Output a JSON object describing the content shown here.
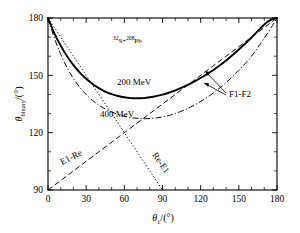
{
  "figure": {
    "system_label": "S+",
    "system_sup1": "32",
    "system_sup2": "208",
    "system_tail": "Pb"
  },
  "axes": {
    "x": {
      "label_main": "θ",
      "label_sub": "1",
      "label_unit": "/(°)",
      "ticks": [
        "0",
        "30",
        "60",
        "90",
        "120",
        "150",
        "180"
      ],
      "tick_values": [
        0,
        30,
        60,
        90,
        120,
        150,
        180
      ],
      "minor_step": 10,
      "min": 0,
      "max": 180
    },
    "y": {
      "label_main": "θ",
      "label_sub": "binary",
      "label_unit": "/(°)",
      "ticks": [
        "90",
        "120",
        "150",
        "180"
      ],
      "tick_values": [
        90,
        120,
        150,
        180
      ],
      "minor_step": 10,
      "min": 90,
      "max": 180
    }
  },
  "annotations": [
    {
      "name": "label-200mev",
      "text": "200 MeV"
    },
    {
      "name": "label-400mev",
      "text": "400 MeV"
    },
    {
      "name": "label-f1f2",
      "text": "F1-F2"
    },
    {
      "name": "label-e1re",
      "text": "E1-Re"
    },
    {
      "name": "label-ree1",
      "text": "Re-E1"
    }
  ],
  "chart_data": {
    "type": "line",
    "title": "32S+208Pb",
    "xlabel": "theta_1/(deg)",
    "ylabel": "theta_binary/(deg)",
    "xlim": [
      0,
      180
    ],
    "ylim": [
      90,
      180
    ],
    "grid": false,
    "legend": "inline-annotations",
    "series": [
      {
        "name": "200 MeV",
        "style": "solid",
        "annotation": "200 MeV",
        "x": [
          0,
          5,
          10,
          15,
          20,
          25,
          30,
          35,
          40,
          45,
          50,
          55,
          60,
          65,
          70,
          75,
          80,
          85,
          90,
          95,
          100,
          110,
          120,
          130,
          140,
          150,
          160,
          170,
          175,
          180
        ],
        "y": [
          180.0,
          172.0,
          165.5,
          160.0,
          155.3,
          151.4,
          148.2,
          145.5,
          143.3,
          141.5,
          140.2,
          139.2,
          138.5,
          138.1,
          138.0,
          138.1,
          138.5,
          139.1,
          139.9,
          140.9,
          142.1,
          145.0,
          148.6,
          152.8,
          157.8,
          163.5,
          169.8,
          176.6,
          179.0,
          180.0
        ]
      },
      {
        "name": "400 MeV",
        "style": "dash-dot",
        "annotation": "400 MeV",
        "x": [
          0,
          5,
          10,
          15,
          20,
          25,
          30,
          35,
          40,
          45,
          50,
          55,
          60,
          65,
          70,
          75,
          80,
          85,
          90,
          95,
          100,
          110,
          120,
          130,
          140,
          150,
          160,
          170,
          175,
          180
        ],
        "y": [
          180.0,
          169.5,
          161.0,
          154.0,
          148.3,
          143.7,
          140.0,
          136.9,
          134.4,
          132.4,
          130.8,
          129.6,
          128.6,
          127.9,
          127.5,
          127.3,
          127.4,
          127.7,
          128.2,
          129.0,
          130.0,
          132.7,
          136.3,
          140.8,
          146.2,
          152.6,
          160.0,
          169.5,
          174.5,
          180.0
        ]
      },
      {
        "name": "F1-F2 upper",
        "style": "dash",
        "annotation": "F1-F2",
        "x": [
          0,
          180
        ],
        "y": [
          90,
          180
        ]
      },
      {
        "name": "E1-Re",
        "style": "dash",
        "annotation": "E1-Re",
        "x": [
          0,
          180
        ],
        "y": [
          90,
          180
        ]
      },
      {
        "name": "Re-E1",
        "style": "dot",
        "annotation": "Re-E1",
        "x": [
          0,
          90
        ],
        "y": [
          180,
          90
        ]
      }
    ]
  }
}
